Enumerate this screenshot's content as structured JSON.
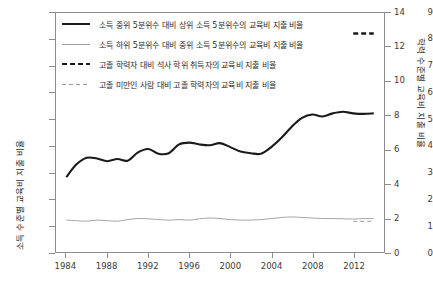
{
  "chart_data": {
    "type": "line",
    "title": "",
    "xlabel": "",
    "ylabel": "소득 수준별 교육비 지출 비율",
    "ylabel_right": "학력 수준별 교육비 지출 비율",
    "xlim": [
      1983,
      2015
    ],
    "ylim": [
      0,
      9
    ],
    "ylim_right": [
      0,
      14
    ],
    "grid": false,
    "legend_position": "upper-left",
    "xticks": [
      1984,
      1988,
      1992,
      1996,
      2000,
      2004,
      2008,
      2012
    ],
    "yticks_left": [
      0,
      1,
      2,
      3,
      4,
      5,
      6,
      7,
      8,
      9
    ],
    "yticks_right": [
      0,
      2,
      4,
      6,
      8,
      10,
      12,
      14
    ],
    "series": [
      {
        "name": "소득 중위 5분위수 대비 상위 소득 5분위수의 교육비 지출 비율",
        "style": "thick-solid",
        "color": "#1a1a1a",
        "axis": "left",
        "x": [
          1984,
          1985,
          1986,
          1987,
          1988,
          1989,
          1990,
          1991,
          1992,
          1993,
          1994,
          1995,
          1996,
          1997,
          1998,
          1999,
          2000,
          2001,
          2002,
          2003,
          2004,
          2005,
          2006,
          2007,
          2008,
          2009,
          2010,
          2011,
          2012,
          2013,
          2014
        ],
        "values": [
          2.82,
          3.3,
          3.55,
          3.52,
          3.42,
          3.5,
          3.44,
          3.75,
          3.88,
          3.7,
          3.72,
          4.05,
          4.12,
          4.05,
          4.02,
          4.1,
          3.95,
          3.78,
          3.72,
          3.7,
          3.95,
          4.3,
          4.72,
          5.05,
          5.18,
          5.1,
          5.22,
          5.28,
          5.22,
          5.2,
          5.22
        ]
      },
      {
        "name": "소득 하위 5분위수 대비 중위 소득 5분위수의 교육비 지출 비율",
        "style": "thin-solid",
        "color": "#9a9a9a",
        "axis": "left",
        "x": [
          1984,
          1985,
          1986,
          1987,
          1988,
          1989,
          1990,
          1991,
          1992,
          1993,
          1994,
          1995,
          1996,
          1997,
          1998,
          1999,
          2000,
          2001,
          2002,
          2003,
          2004,
          2005,
          2006,
          2007,
          2008,
          2009,
          2010,
          2011,
          2012,
          2013,
          2014
        ],
        "values": [
          1.2,
          1.18,
          1.16,
          1.2,
          1.18,
          1.16,
          1.22,
          1.26,
          1.25,
          1.22,
          1.2,
          1.22,
          1.2,
          1.25,
          1.28,
          1.26,
          1.22,
          1.2,
          1.2,
          1.22,
          1.26,
          1.3,
          1.32,
          1.3,
          1.28,
          1.26,
          1.26,
          1.25,
          1.24,
          1.26,
          1.26
        ]
      },
      {
        "name": "고졸 학력자 대비 석사 학위 취득자의 교육비 지출 비율",
        "style": "thick-dash",
        "color": "#1a1a1a",
        "axis": "right",
        "x": [
          2012,
          2014
        ],
        "values": [
          12.8,
          12.8
        ]
      },
      {
        "name": "고졸 미만인 사람 대비 고졸 학력자의 교육비 지출 비율",
        "style": "thin-dash",
        "color": "#9a9a9a",
        "axis": "right",
        "x": [
          2012,
          2014
        ],
        "values": [
          1.8,
          1.8
        ]
      }
    ]
  },
  "legend": {
    "items": [
      {
        "label": "소득 중위 5분위수 대비 상위 소득 5분위수의 교육비 지출 비율",
        "style": "thick-solid"
      },
      {
        "label": "소득 하위 5분위수 대비 중위 소득 5분위수의 교육비 지출 비율",
        "style": "thin-solid"
      },
      {
        "label": "고졸 학력자 대비 석사 학위 취득자의 교육비 지출 비율",
        "style": "thick-dash"
      },
      {
        "label": "고졸 미만인 사람 대비 고졸 학력자의 교육비 지출 비율",
        "style": "thin-dash"
      }
    ]
  }
}
